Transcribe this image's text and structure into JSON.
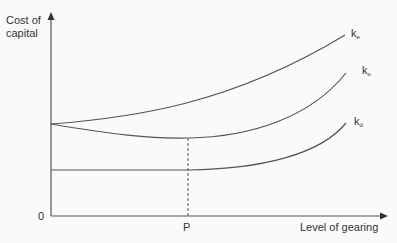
{
  "diagram": {
    "y_axis_label_line1": "Cost of",
    "y_axis_label_line2": "capital",
    "x_axis_label": "Level of gearing",
    "origin_label": "0",
    "p_label": "P",
    "curves": [
      {
        "name": "ke",
        "base": "k",
        "sub": "e",
        "description": "Cost of equity — rises with gearing"
      },
      {
        "name": "ko",
        "base": "k",
        "sub": "o",
        "description": "WACC — U-shaped, minimum at P"
      },
      {
        "name": "kd",
        "base": "k",
        "sub": "d",
        "description": "Cost of debt — flat then rising"
      }
    ],
    "line_color": "#555555",
    "background": "#fafafa"
  }
}
